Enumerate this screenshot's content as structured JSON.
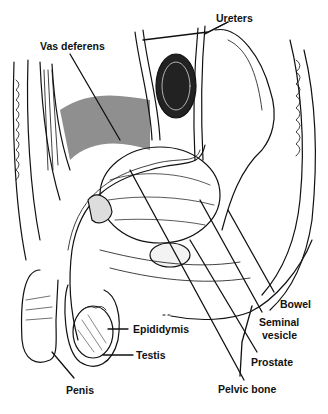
{
  "figure": {
    "type": "anatomical-line-illustration",
    "colors": {
      "ink": "#111111",
      "background": "#ffffff",
      "shade": "#555555"
    },
    "labels": [
      {
        "id": "ureters",
        "text": "Ureters",
        "x": 216,
        "y": 12
      },
      {
        "id": "vas-deferens",
        "text": "Vas deferens",
        "x": 40,
        "y": 40
      },
      {
        "id": "bowel",
        "text": "Bowel",
        "x": 280,
        "y": 298
      },
      {
        "id": "seminal-vesicle-1",
        "text": "Seminal",
        "x": 259,
        "y": 316
      },
      {
        "id": "seminal-vesicle-2",
        "text": "vesicle",
        "x": 262,
        "y": 329
      },
      {
        "id": "epididymis",
        "text": "Epididymis",
        "x": 133,
        "y": 324
      },
      {
        "id": "testis",
        "text": "Testis",
        "x": 136,
        "y": 350
      },
      {
        "id": "prostate",
        "text": "Prostate",
        "x": 251,
        "y": 357
      },
      {
        "id": "penis",
        "text": "Penis",
        "x": 66,
        "y": 385
      },
      {
        "id": "pelvic-bone",
        "text": "Pelvic bone",
        "x": 218,
        "y": 384
      }
    ]
  }
}
